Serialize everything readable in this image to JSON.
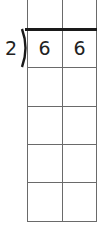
{
  "problem": {
    "type": "long-division-grid",
    "divisor": "2",
    "dividend_digits": [
      "6",
      "6"
    ],
    "quotient_digits": [
      "",
      ""
    ],
    "work_rows": 4,
    "columns": 2
  },
  "colors": {
    "grid_line": "#6a6a6a",
    "division_bar": "#1a1a1a",
    "text": "#222222"
  }
}
